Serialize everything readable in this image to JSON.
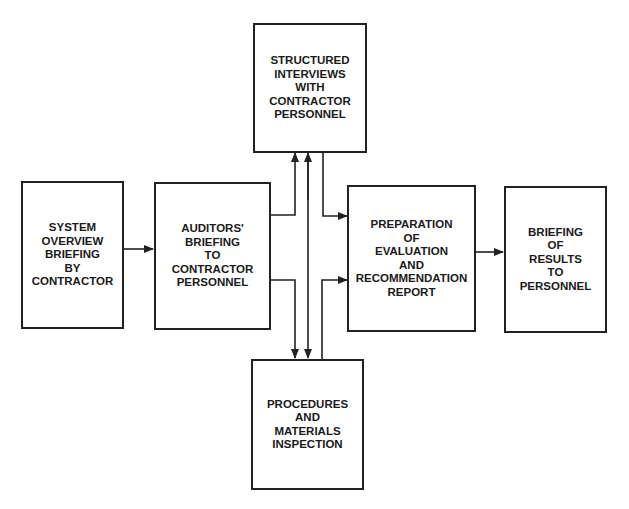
{
  "diagram": {
    "title": "",
    "nodes": [
      {
        "id": "system_overview",
        "label": "SYSTEM\nOVERVIEW\nBRIEFING\nBY\nCONTRACTOR"
      },
      {
        "id": "auditors_briefing",
        "label": "AUDITORS'\nBRIEFING\nTO\nCONTRACTOR\nPERSONNEL"
      },
      {
        "id": "structured_interviews",
        "label": "STRUCTURED\nINTERVIEWS\nWITH\nCONTRACTOR\nPERSONNEL"
      },
      {
        "id": "procedures_inspection",
        "label": "PROCEDURES\nAND\nMATERIALS\nINSPECTION"
      },
      {
        "id": "preparation_report",
        "label": "PREPARATION\nOF\nEVALUATION\nAND\nRECOMMENDATION\nREPORT"
      },
      {
        "id": "briefing_results",
        "label": "BRIEFING\nOF\nRESULTS\nTO\nPERSONNEL"
      }
    ],
    "edges": [
      {
        "from": "system_overview",
        "to": "auditors_briefing"
      },
      {
        "from": "auditors_briefing",
        "to": "structured_interviews"
      },
      {
        "from": "auditors_briefing",
        "to": "procedures_inspection"
      },
      {
        "from": "structured_interviews",
        "to": "procedures_inspection",
        "bidirectional": true
      },
      {
        "from": "structured_interviews",
        "to": "preparation_report"
      },
      {
        "from": "procedures_inspection",
        "to": "preparation_report"
      },
      {
        "from": "preparation_report",
        "to": "briefing_results"
      }
    ],
    "colors": {
      "line": "#222222",
      "text": "#1a1a1a",
      "background": "#ffffff"
    }
  }
}
